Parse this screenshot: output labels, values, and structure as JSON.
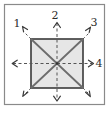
{
  "figure": {
    "width": 111,
    "height": 113,
    "background_color": "#ffffff",
    "outer_frame": {
      "name": "outer-frame",
      "x": 4.5,
      "y": 4.5,
      "width": 100,
      "height": 100,
      "stroke_color": "#8a8a8a",
      "fill_color": "#ffffff",
      "stroke_width": 1.2
    },
    "inner_square": {
      "name": "inner-square",
      "x": 31,
      "y": 39,
      "width": 52,
      "height": 49,
      "stroke_color": "#3a3a3a",
      "fill_color": "#e6e6e6",
      "stroke_width": 1.6
    },
    "center_point": {
      "x": 57,
      "y": 63.5
    },
    "diagonals": {
      "name": "diagonal-lines",
      "stroke_color": "#6d6d6d",
      "stroke_width": 1.8,
      "style": "solid"
    },
    "axes": {
      "name": "dashed-axes",
      "stroke_color": "#555555",
      "stroke_width": 1.0,
      "style": "dashed",
      "dash_pattern": "3,2.5"
    },
    "arrows": [
      {
        "id": "a1",
        "label": "1",
        "direction": "up-left",
        "labeled": true,
        "tip_x": 23,
        "tip_y": 27,
        "tail_x": 31,
        "tail_y": 35
      },
      {
        "id": "a2",
        "label": "2",
        "direction": "up",
        "labeled": true,
        "tip_x": 57,
        "tip_y": 22,
        "tail_x": 57,
        "tail_y": 39
      },
      {
        "id": "a3",
        "label": "3",
        "direction": "up-right",
        "labeled": true,
        "tip_x": 90,
        "tip_y": 28,
        "tail_x": 83,
        "tail_y": 35
      },
      {
        "id": "a4",
        "label": "4",
        "direction": "right",
        "labeled": true,
        "tip_x": 93,
        "tip_y": 63.5,
        "tail_x": 83,
        "tail_y": 63.5
      },
      {
        "id": "a5",
        "label": "",
        "direction": "down-right",
        "labeled": false,
        "tip_x": 90,
        "tip_y": 97,
        "tail_x": 83,
        "tail_y": 90
      },
      {
        "id": "a6",
        "label": "",
        "direction": "down",
        "labeled": false,
        "tip_x": 57,
        "tip_y": 101,
        "tail_x": 57,
        "tail_y": 88
      },
      {
        "id": "a7",
        "label": "",
        "direction": "down-left",
        "labeled": false,
        "tip_x": 23,
        "tip_y": 97,
        "tail_x": 31,
        "tail_y": 90
      },
      {
        "id": "a8",
        "label": "",
        "direction": "left",
        "labeled": false,
        "tip_x": 12,
        "tip_y": 63.5,
        "tail_x": 31,
        "tail_y": 63.5
      }
    ],
    "labels": [
      {
        "id": "n1",
        "text": "1",
        "x": 19,
        "y": 26,
        "name": "direction-label-1"
      },
      {
        "id": "n2",
        "text": "2",
        "x": 53,
        "y": 18,
        "name": "direction-label-2"
      },
      {
        "id": "n3",
        "text": "3",
        "x": 92,
        "y": 26,
        "name": "direction-label-3"
      },
      {
        "id": "n4",
        "text": "4",
        "x": 96,
        "y": 67,
        "name": "direction-label-4"
      }
    ]
  }
}
